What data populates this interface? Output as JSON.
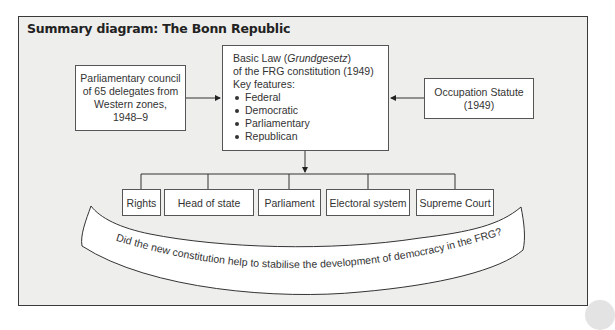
{
  "diagram": {
    "title": "Summary diagram: The Bonn Republic",
    "left_box": {
      "lines": [
        "Parliamentary council",
        "of 65 delegates from",
        "Western zones,",
        "1948–9"
      ]
    },
    "main_box": {
      "line1_prefix": "Basic Law (",
      "line1_italic": "Grundgesetz",
      "line1_suffix": ")",
      "line2": "of the FRG constitution (1949)",
      "line3": "Key features:",
      "features": [
        "Federal",
        "Democratic",
        "Parliamentary",
        "Republican"
      ]
    },
    "right_box": {
      "lines": [
        "Occupation Statute",
        "(1949)"
      ]
    },
    "bottom_boxes": [
      {
        "label": "Rights"
      },
      {
        "label": "Head of state"
      },
      {
        "label": "Parliament"
      },
      {
        "label": "Electoral system"
      },
      {
        "label": "Supreme Court"
      }
    ],
    "banner_question": "Did the new constitution help to stabilise the development of democracy in the FRG?"
  },
  "colors": {
    "frame_border": "#3a3a3a",
    "frame_fill": "#eeeeec",
    "box_fill": "#ffffff",
    "line": "#333333"
  }
}
